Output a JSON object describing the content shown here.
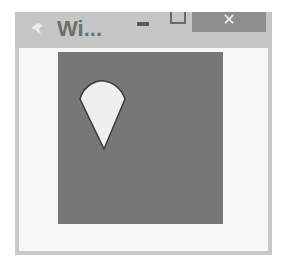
{
  "window": {
    "title": "Wi...",
    "icon": "app-icon",
    "controls": {
      "minimize": "minimize-icon",
      "maximize": "maximize-icon",
      "close_label": "✕"
    }
  },
  "canvas": {
    "background": "#777777",
    "shape": {
      "type": "cone-drop",
      "fill": "#efefef",
      "stroke": "#3a3a3a"
    }
  }
}
